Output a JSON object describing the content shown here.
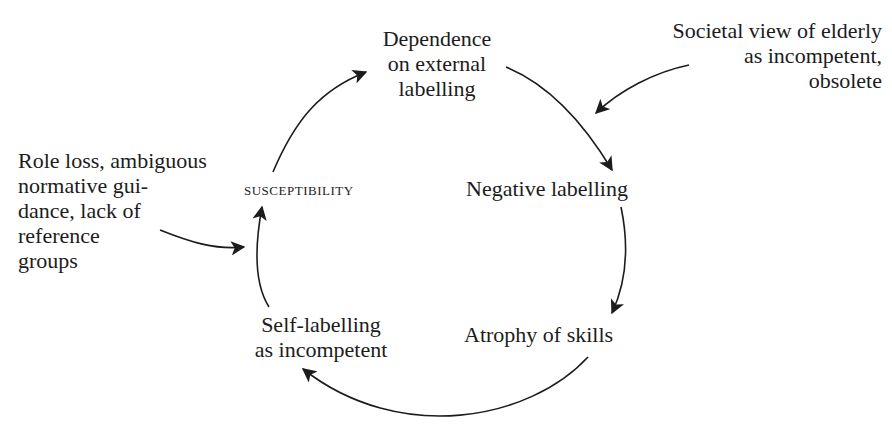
{
  "diagram": {
    "type": "cycle",
    "center_label": "susceptibility",
    "nodes": [
      {
        "id": "dependence",
        "lines": [
          "Dependence",
          "on external",
          "labelling"
        ]
      },
      {
        "id": "negative",
        "lines": [
          "Negative labelling"
        ]
      },
      {
        "id": "atrophy",
        "lines": [
          "Atrophy of skills"
        ]
      },
      {
        "id": "self",
        "lines": [
          "Self-labelling",
          "as incompetent"
        ]
      },
      {
        "id": "susceptibility",
        "lines": [
          "SUSCEPTIBILITY"
        ]
      }
    ],
    "external_inputs": [
      {
        "id": "societal",
        "lines": [
          "Societal view of elderly",
          "as incompetent,",
          "obsolete"
        ],
        "target": "negative"
      },
      {
        "id": "role",
        "lines": [
          "Role loss, ambiguous",
          "normative gui-",
          "dance, lack of",
          "reference",
          "groups"
        ],
        "target": "susceptibility"
      }
    ],
    "edges": [
      {
        "from": "susceptibility",
        "to": "dependence"
      },
      {
        "from": "dependence",
        "to": "negative"
      },
      {
        "from": "negative",
        "to": "atrophy"
      },
      {
        "from": "atrophy",
        "to": "self"
      },
      {
        "from": "self",
        "to": "susceptibility"
      }
    ],
    "colors": {
      "line": "#1c1c1c",
      "background": "#ffffff"
    }
  }
}
